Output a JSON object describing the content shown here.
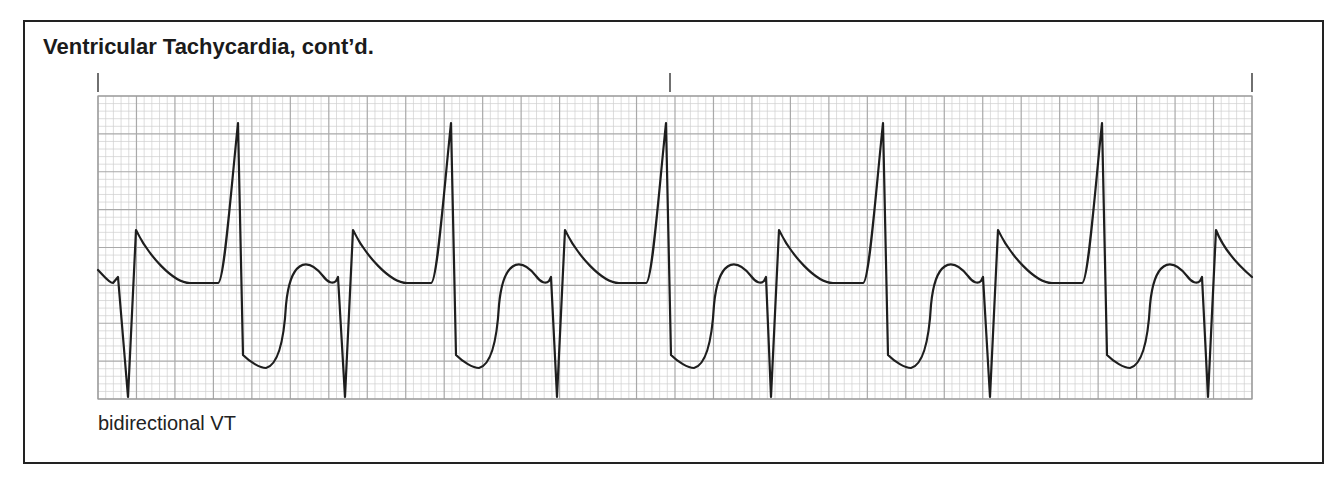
{
  "header": {
    "title": "Ventricular Tachycardia, cont’d."
  },
  "strip": {
    "caption": "bidirectional VT",
    "grid": {
      "x": 98,
      "y": 96,
      "width": 1154,
      "height": 303,
      "major_cols": 30,
      "major_rows": 8,
      "minor_per_major": 5,
      "major_color": "#a9a9a9",
      "minor_color": "#cfcfcf",
      "border_color": "#9a9a9a"
    },
    "time_markers_x": [
      98,
      670,
      1252
    ],
    "trace_color": "#1e1e1e"
  },
  "chart_data": {
    "type": "line",
    "title": "Ventricular Tachycardia, cont’d.",
    "subtitle": "bidirectional VT",
    "xlabel": "",
    "ylabel": "",
    "grid": true,
    "time_markers": 3,
    "beats": [
      {
        "index": 1,
        "type": "negative",
        "nadir_x": 128
      },
      {
        "index": 2,
        "type": "positive",
        "peak_x": 238
      },
      {
        "index": 3,
        "type": "negative",
        "nadir_x": 345
      },
      {
        "index": 4,
        "type": "positive",
        "peak_x": 451
      },
      {
        "index": 5,
        "type": "negative",
        "nadir_x": 557
      },
      {
        "index": 6,
        "type": "positive",
        "peak_x": 666
      },
      {
        "index": 7,
        "type": "negative",
        "nadir_x": 771
      },
      {
        "index": 8,
        "type": "positive",
        "peak_x": 883
      },
      {
        "index": 9,
        "type": "negative",
        "nadir_x": 990
      },
      {
        "index": 10,
        "type": "positive",
        "peak_x": 1102
      },
      {
        "index": 11,
        "type": "negative",
        "nadir_x": 1208
      }
    ]
  }
}
